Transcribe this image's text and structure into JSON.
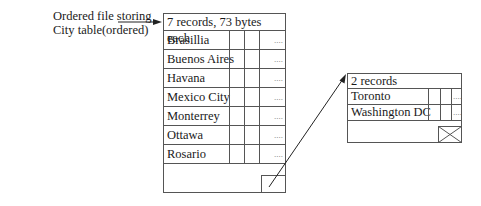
{
  "label": {
    "line1": "Ordered file storing",
    "line2": "City table(ordered)"
  },
  "primary_block": {
    "header": "7 records, 73 bytes each",
    "rows": [
      {
        "name": "Brasillia",
        "more": "...."
      },
      {
        "name": "Buenos Aires",
        "more": "...."
      },
      {
        "name": "Havana",
        "more": "...."
      },
      {
        "name": "Mexico City",
        "more": "...."
      },
      {
        "name": "Monterrey",
        "more": "...."
      },
      {
        "name": "Ottawa",
        "more": "...."
      },
      {
        "name": "Rosario",
        "more": "...."
      }
    ]
  },
  "overflow_block": {
    "header": "2 records",
    "rows": [
      {
        "name": "Toronto",
        "more": "...."
      },
      {
        "name": "Washington DC",
        "more": "...."
      }
    ]
  },
  "colors": {
    "line": "#555555",
    "text": "#1a1a1a"
  }
}
